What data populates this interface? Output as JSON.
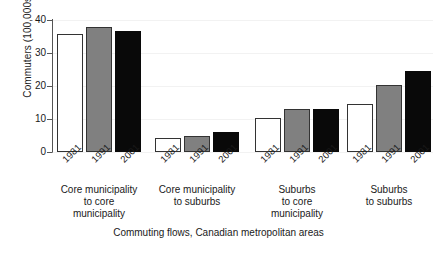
{
  "chart_data": {
    "type": "bar",
    "title": "",
    "subtitle": "",
    "xlabel": "Commuting flows, Canadian metropolitan areas",
    "ylabel": "Commuters (100,000s)",
    "categories": [
      "Core municipality\nto core\nmunicipality",
      "Core municipality\nto suburbs",
      "Suburbs\nto core\nmunicipality",
      "Suburbs\nto suburbs"
    ],
    "series": [
      {
        "name": "1981",
        "color": "#ffffff",
        "values": [
          35.8,
          4.2,
          10.3,
          14.7
        ]
      },
      {
        "name": "1991",
        "color": "#808080",
        "values": [
          38.0,
          4.9,
          13.0,
          20.2
        ]
      },
      {
        "name": "2001",
        "color": "#090909",
        "values": [
          36.8,
          6.1,
          13.1,
          24.5
        ]
      }
    ],
    "xtick_labels": [
      "1981",
      "1991",
      "2001",
      "1981",
      "1991",
      "2001",
      "1981",
      "1991",
      "2001",
      "1981",
      "1991",
      "2001"
    ],
    "ylim": [
      0,
      40
    ],
    "yticks": [
      0,
      10,
      20,
      30,
      40
    ],
    "ytick_labels": [
      "0",
      "10",
      "20",
      "30",
      "40"
    ],
    "grid": true,
    "legend": "none",
    "bar_edge_color": "#333333",
    "axis_color": "#555555"
  }
}
